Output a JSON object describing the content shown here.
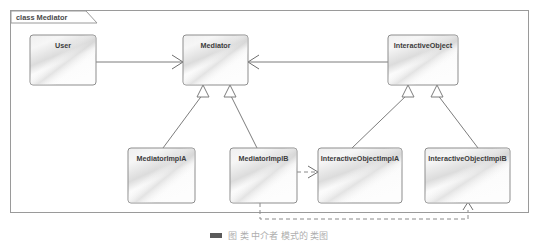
{
  "frame": {
    "tab_label": "class Mediator"
  },
  "caption": {
    "text": "图 类 中介者 模式的 类图"
  },
  "colors": {
    "frame_border": "#9a9a9a",
    "box_border": "#8d8d8d",
    "box_fill_light": "#fdfdfd",
    "box_fill_gray": "#d9d9d9",
    "line": "#7d7d7d",
    "label_text": "#3c3c3c"
  },
  "classes": [
    {
      "id": "user",
      "label": "User",
      "x": 30,
      "y": 35,
      "w": 66,
      "h": 50
    },
    {
      "id": "mediator",
      "label": "Mediator",
      "x": 183,
      "y": 35,
      "w": 65,
      "h": 50
    },
    {
      "id": "interactive-object",
      "label": "InteractiveObject",
      "x": 388,
      "y": 35,
      "w": 70,
      "h": 50
    },
    {
      "id": "mediator-impl-a",
      "label": "MediatorImplA",
      "x": 128,
      "y": 148,
      "w": 67,
      "h": 55
    },
    {
      "id": "mediator-impl-b",
      "label": "MediatorImplB",
      "x": 230,
      "y": 148,
      "w": 67,
      "h": 55
    },
    {
      "id": "interactive-impl-a",
      "label": "InteractiveObjectImplA",
      "x": 318,
      "y": 148,
      "w": 84,
      "h": 55
    },
    {
      "id": "interactive-impl-b",
      "label": "InteractiveObjectImplB",
      "x": 425,
      "y": 148,
      "w": 85,
      "h": 55
    }
  ],
  "relations": [
    {
      "id": "user-to-mediator",
      "type": "association",
      "from": "user",
      "to": "mediator",
      "style": "solid"
    },
    {
      "id": "interactive-to-mediator",
      "type": "association",
      "from": "interactive-object",
      "to": "mediator",
      "style": "solid"
    },
    {
      "id": "mediator-impl-a-generalizes",
      "type": "generalization",
      "from": "mediator-impl-a",
      "to": "mediator",
      "style": "solid"
    },
    {
      "id": "mediator-impl-b-generalizes",
      "type": "generalization",
      "from": "mediator-impl-b",
      "to": "mediator",
      "style": "solid"
    },
    {
      "id": "interactive-impl-a-generalizes",
      "type": "generalization",
      "from": "interactive-impl-a",
      "to": "interactive-object",
      "style": "solid"
    },
    {
      "id": "interactive-impl-b-generalizes",
      "type": "generalization",
      "from": "interactive-impl-b",
      "to": "interactive-object",
      "style": "solid"
    },
    {
      "id": "implb-to-interactive-impl-a",
      "type": "dependency",
      "from": "mediator-impl-b",
      "to": "interactive-impl-a",
      "style": "dashed"
    },
    {
      "id": "implb-to-interactive-impl-b",
      "type": "dependency",
      "from": "mediator-impl-b",
      "to": "interactive-impl-b",
      "style": "dashed"
    }
  ]
}
